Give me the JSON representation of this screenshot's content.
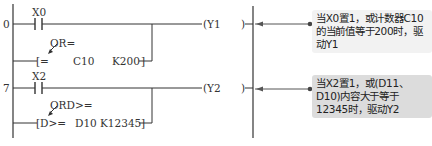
{
  "rungs": [
    {
      "step": "0",
      "contact": "X0",
      "compare_label": "OR=",
      "compare": {
        "open": "[=",
        "op1": "C10",
        "op2": "K200",
        "close": "]"
      },
      "coil": {
        "open": "(Y1",
        "close": ")"
      },
      "note": "当X0置1，或计数器C10的当前值等于200时，驱动Y1"
    },
    {
      "step": "7",
      "contact": "X2",
      "compare_label": "ORD>=",
      "compare": {
        "open": "[D>=",
        "op1": "D10",
        "op2": "K12345",
        "close": "]"
      },
      "coil": {
        "open": "(Y2",
        "close": ")"
      },
      "note": "当X2置1，或(D11、D10)内容大于等于12345时，驱动Y2"
    }
  ],
  "colors": {
    "line": "#333333",
    "note1_bg": "#f2f2f2",
    "note2_bg": "#dcdcdc"
  }
}
